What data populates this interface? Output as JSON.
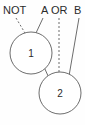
{
  "diagram": {
    "type": "logic-expression-annotation",
    "background_color": "#fefefe",
    "stroke_color": "#6d6d6d",
    "text_color": "#2b2b2b",
    "expression": {
      "label_not": "NOT",
      "label_a": "A",
      "label_or": "OR",
      "label_b": "B",
      "full_text": "NOT  A OR B"
    },
    "nodes": [
      {
        "id": "node-1",
        "label": "1",
        "cx": 31,
        "cy": 53,
        "r": 21
      },
      {
        "id": "node-2",
        "label": "2",
        "cx": 60,
        "cy": 93,
        "r": 21
      }
    ],
    "leaders": [
      {
        "from": "NOT",
        "to": "node-1",
        "style": "dashed"
      },
      {
        "from": "A",
        "to": "node-1",
        "style": "solid"
      },
      {
        "from": "OR",
        "to": "node-2",
        "style": "dashed"
      },
      {
        "from": "B",
        "to": "node-2",
        "style": "solid"
      }
    ],
    "connector": {
      "from": "node-1",
      "to": "node-2",
      "style": "solid"
    }
  }
}
